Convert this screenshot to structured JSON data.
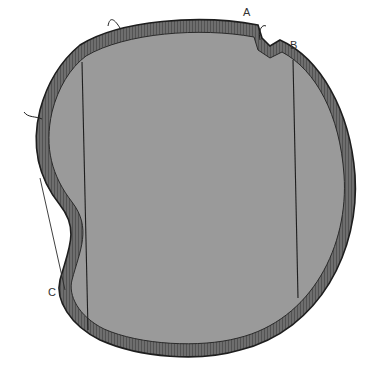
{
  "figure": {
    "type": "technical illustration",
    "labels": [
      {
        "id": "A",
        "text": "A"
      },
      {
        "id": "B",
        "text": "B"
      },
      {
        "id": "C",
        "text": "C"
      }
    ],
    "colors": {
      "fill": "#9a9a9a",
      "edge": "#5a5a5a",
      "outline": "#1e1e1e",
      "background": "#ffffff"
    }
  }
}
